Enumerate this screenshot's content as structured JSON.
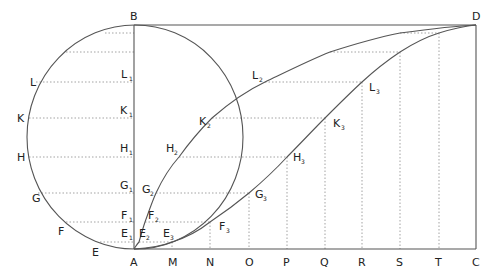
{
  "diagram": {
    "type": "geometric-construction",
    "colors": {
      "line": "#555555",
      "dotted": "#999999",
      "text": "#222222"
    },
    "corners": {
      "top_left": "B",
      "top_right": "D",
      "bottom_left": "A",
      "bottom_right": "C"
    },
    "circle_labels": [
      "L",
      "K",
      "H",
      "G",
      "F",
      "E"
    ],
    "axis_labels": [
      "L1",
      "K1",
      "H1",
      "G1",
      "F1",
      "E1"
    ],
    "curve2_labels": [
      "L2",
      "K2",
      "H2",
      "G2",
      "F2",
      "E2"
    ],
    "curve3_labels": [
      "L3",
      "K3",
      "H3",
      "G3",
      "F3",
      "E3"
    ],
    "baseline_labels": [
      "A",
      "M",
      "N",
      "O",
      "P",
      "Q",
      "R",
      "S",
      "T",
      "C"
    ]
  },
  "labels": {
    "B": "B",
    "D": "D",
    "A": "A",
    "C": "C",
    "L": "L",
    "K": "K",
    "H": "H",
    "G": "G",
    "F": "F",
    "E": "E",
    "M": "M",
    "N": "N",
    "O": "O",
    "P": "P",
    "Q": "Q",
    "R": "R",
    "S": "S",
    "T": "T",
    "sub1": "1",
    "sub2": "2",
    "sub3": "3"
  }
}
